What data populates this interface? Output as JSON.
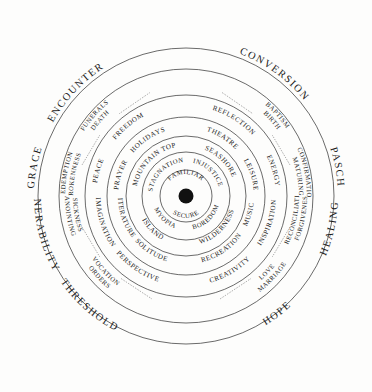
{
  "diagram": {
    "center": {
      "dot": "center-point"
    },
    "colors": {
      "stroke": "#2b2b2b",
      "text": "#1a1a1a",
      "background": "#fdfdfc",
      "center_dot": "#111111"
    },
    "rings": [
      {
        "index": 1,
        "name": "core",
        "labels": [
          {
            "text": "FAMILIAR",
            "position": "top"
          },
          {
            "text": "SECURE",
            "position": "bottom"
          }
        ]
      },
      {
        "index": 2,
        "name": "comfort-zone-traps",
        "labels": [
          {
            "text": "STAGNATION",
            "position": "upper-left"
          },
          {
            "text": "INJUSTICE",
            "position": "upper-right"
          },
          {
            "text": "BOREDOM",
            "position": "lower-right"
          },
          {
            "text": "MYOPIA",
            "position": "lower-left"
          }
        ]
      },
      {
        "index": 3,
        "name": "places",
        "labels": [
          {
            "text": "MOUNTAIN TOP",
            "position": "upper-left"
          },
          {
            "text": "SEASHORE",
            "position": "upper-right"
          },
          {
            "text": "WILDERNESS",
            "position": "lower-right"
          },
          {
            "text": "ISLAND",
            "position": "lower-left"
          }
        ]
      },
      {
        "index": 4,
        "name": "practices",
        "labels": [
          {
            "text": "PRAYER",
            "position": "left-upper"
          },
          {
            "text": "HOLIDAYS",
            "position": "upper-left"
          },
          {
            "text": "THEATRE",
            "position": "upper-right"
          },
          {
            "text": "LEISURE",
            "position": "right-upper"
          },
          {
            "text": "MUSIC",
            "position": "right-lower"
          },
          {
            "text": "RECREATION",
            "position": "lower-right"
          },
          {
            "text": "SOLITUDE",
            "position": "lower-left"
          },
          {
            "text": "LITERATURE",
            "position": "left-lower"
          }
        ]
      },
      {
        "index": 5,
        "name": "qualities",
        "labels": [
          {
            "text": "PEACE",
            "position": "left-upper"
          },
          {
            "text": "FREEDOM",
            "position": "upper-left"
          },
          {
            "text": "REFLECTION",
            "position": "upper-right"
          },
          {
            "text": "ENERGY",
            "position": "right-upper"
          },
          {
            "text": "INSPIRATION",
            "position": "right-lower"
          },
          {
            "text": "CREATIVITY",
            "position": "lower-right"
          },
          {
            "text": "PERSPECTIVE",
            "position": "lower-left"
          },
          {
            "text": "IMAGINATION",
            "position": "left-lower"
          }
        ]
      },
      {
        "index": 6,
        "name": "sacraments",
        "pairs": [
          {
            "top": "FUNERALS",
            "bottom": "DEATH",
            "position": "top-left"
          },
          {
            "top": "BAPTISM",
            "bottom": "BIRTH",
            "position": "top-right"
          },
          {
            "top": "CONFIRMATION",
            "bottom": "MATURING",
            "position": "right-upper"
          },
          {
            "top": "FORGIVENESS",
            "bottom": "RECONCILIATION",
            "position": "right-lower"
          },
          {
            "top": "LOVE",
            "bottom": "MARRIAGE",
            "position": "bottom-right"
          },
          {
            "top": "VOCATION",
            "bottom": "ORDERS",
            "position": "bottom-left"
          },
          {
            "top": "SICKNESS",
            "bottom": "ANOINTING",
            "position": "left-lower"
          },
          {
            "top": "REDEMPTION",
            "bottom": "BROKENNESS",
            "position": "left-upper"
          }
        ]
      }
    ],
    "outer_labels": [
      {
        "text": "ENCOUNTER",
        "position": "top-left"
      },
      {
        "text": "CONVERSION",
        "position": "top-right"
      },
      {
        "text": "PASCH",
        "position": "right-upper"
      },
      {
        "text": "HEALING",
        "position": "right-lower"
      },
      {
        "text": "HOPE",
        "position": "bottom-right"
      },
      {
        "text": "THRESHOLD",
        "position": "bottom-left"
      },
      {
        "text": "VULNERABILITY",
        "position": "left-lower"
      },
      {
        "text": "GRACE",
        "position": "left-upper"
      }
    ]
  }
}
